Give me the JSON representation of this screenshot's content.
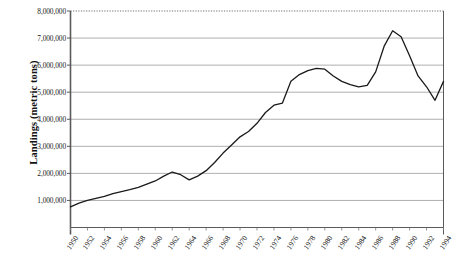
{
  "chart_data": {
    "type": "line",
    "title": "",
    "xlabel": "",
    "ylabel": "Landings (metric tons)",
    "ylim": [
      0,
      8000000
    ],
    "xlim": [
      1950,
      1994
    ],
    "grid": true,
    "legend": false,
    "y_ticks": [
      "1,000,000",
      "2,000,000",
      "3,000,000",
      "4,000,000",
      "5,000,000",
      "6,000,000",
      "7,000,000",
      "8,000,000"
    ],
    "y_tick_values": [
      1000000,
      2000000,
      3000000,
      4000000,
      5000000,
      6000000,
      7000000,
      8000000
    ],
    "x_ticks": [
      "1950",
      "1952",
      "1954",
      "1956",
      "1958",
      "1960",
      "1962",
      "1964",
      "1966",
      "1968",
      "1970",
      "1972",
      "1974",
      "1976",
      "1978",
      "1980",
      "1982",
      "1984",
      "1986",
      "1988",
      "1990",
      "1992",
      "1994"
    ],
    "x": [
      1950,
      1951,
      1952,
      1953,
      1954,
      1955,
      1956,
      1957,
      1958,
      1959,
      1960,
      1961,
      1962,
      1963,
      1964,
      1965,
      1966,
      1967,
      1968,
      1969,
      1970,
      1971,
      1972,
      1973,
      1974,
      1975,
      1976,
      1977,
      1978,
      1979,
      1980,
      1981,
      1982,
      1983,
      1984,
      1985,
      1986,
      1987,
      1988,
      1989,
      1990,
      1991,
      1992,
      1993,
      1994
    ],
    "values": [
      760000,
      900000,
      1000000,
      1080000,
      1150000,
      1250000,
      1330000,
      1400000,
      1480000,
      1600000,
      1720000,
      1900000,
      2050000,
      1950000,
      1760000,
      1900000,
      2100000,
      2400000,
      2750000,
      3050000,
      3350000,
      3550000,
      3850000,
      4250000,
      4520000,
      4600000,
      5400000,
      5650000,
      5800000,
      5880000,
      5850000,
      5600000,
      5400000,
      5280000,
      5200000,
      5250000,
      5750000,
      6700000,
      7270000,
      7050000,
      6350000,
      5600000,
      5200000,
      4700000,
      5400000
    ],
    "series_name": "Landings",
    "line_color": "#1a1a1a",
    "grid_color": "#9a9a9a",
    "axis_color": "#555555",
    "top_line_style": "dotted",
    "background": "#ffffff"
  }
}
